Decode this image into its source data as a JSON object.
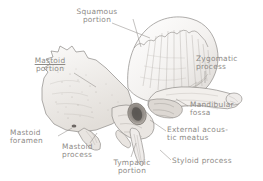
{
  "figure": {
    "style": "anatomical line engraving",
    "background_color": "#ffffff",
    "ink_color": "#8d8a86"
  },
  "labels": [
    {
      "id": "squamous-portion",
      "line1": "Squamous",
      "line2": "portion",
      "x": 66,
      "y": 8,
      "w": 62,
      "align": "center"
    },
    {
      "id": "mastoid-portion",
      "line1": "Mastoid",
      "line2": "portion",
      "x": 22,
      "y": 57,
      "w": 56,
      "align": "center",
      "underline_line1": true
    },
    {
      "id": "zygomatic-process",
      "line1": "Zygomatic",
      "line2": "process",
      "x": 196,
      "y": 55,
      "w": 62,
      "align": "left"
    },
    {
      "id": "mandibular-fossa",
      "line1": "Mandibular",
      "line2": "fossa",
      "x": 190,
      "y": 101,
      "w": 70,
      "align": "left"
    },
    {
      "id": "external-acoustic-meatus",
      "line1": "External acous-",
      "line2": "tic meatus",
      "x": 167,
      "y": 126,
      "w": 92,
      "align": "left"
    },
    {
      "id": "styloid-process",
      "line1": "Styloid process",
      "line2": "",
      "x": 172,
      "y": 157,
      "w": 88,
      "align": "left"
    },
    {
      "id": "mastoid-foramen",
      "line1": "Mastoid",
      "line2": "foramen",
      "x": 10,
      "y": 129,
      "w": 56,
      "align": "left"
    },
    {
      "id": "mastoid-process",
      "line1": "Mastoid",
      "line2": "process",
      "x": 62,
      "y": 143,
      "w": 54,
      "align": "left"
    },
    {
      "id": "tympanic-portion",
      "line1": "Tympanic",
      "line2": "portion",
      "x": 104,
      "y": 159,
      "w": 56,
      "align": "center"
    }
  ],
  "leader_lines": [
    {
      "id": "leader-squamous",
      "d": "M112 23 L150 38"
    },
    {
      "id": "leader-squamous-2",
      "d": "M133 19 L141 47"
    },
    {
      "id": "leader-mastoid-portion",
      "d": "M74 73 L96 87"
    },
    {
      "id": "leader-zygomatic",
      "d": "M205 71 L205 83"
    },
    {
      "id": "leader-mandibular",
      "d": "M188 106 L176 99"
    },
    {
      "id": "leader-eam",
      "d": "M166 131 L150 120"
    },
    {
      "id": "leader-styloid",
      "d": "M171 160 L160 150"
    },
    {
      "id": "leader-mastoid-foramen",
      "d": "M58 136 L72 128"
    },
    {
      "id": "leader-mastoid-process",
      "d": "M90 143 L97 133"
    },
    {
      "id": "leader-tympanic",
      "d": "M131 157 L136 143"
    }
  ]
}
